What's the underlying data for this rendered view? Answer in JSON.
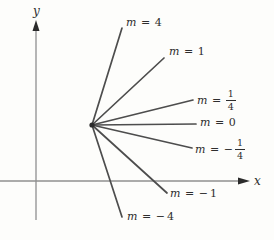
{
  "diagram": {
    "x_axis_label": "x",
    "y_axis_label": "y",
    "colors": {
      "background": "#fdfdfb",
      "axis": "#8f8f8f",
      "slope_line": "#4d4d4d",
      "arrowhead": "#2b2b2b",
      "text": "#2e2e2e"
    },
    "origin_point": {
      "x": 92,
      "y": 125
    },
    "axes": {
      "y_axis": {
        "x": 36,
        "top": 20,
        "bottom": 220,
        "label_x": 33,
        "label_y": 5
      },
      "x_axis": {
        "y": 181,
        "left": 0,
        "right": 250,
        "label_x": 254,
        "label_y": 175
      }
    },
    "lines": [
      {
        "id": "m-4",
        "slope": 4,
        "x2": 122,
        "y2": 28,
        "lx": 126,
        "ly": 17,
        "label": {
          "var": "m",
          "eq": "=",
          "sign": "",
          "whole": "4"
        }
      },
      {
        "id": "m-1",
        "slope": 1,
        "x2": 164,
        "y2": 58,
        "lx": 169,
        "ly": 46,
        "label": {
          "var": "m",
          "eq": "=",
          "sign": "",
          "whole": "1"
        }
      },
      {
        "id": "m-1-4",
        "slope": 0.25,
        "x2": 193,
        "y2": 100,
        "lx": 197,
        "ly": 90,
        "label": {
          "var": "m",
          "eq": "=",
          "sign": "",
          "num": "1",
          "den": "4"
        }
      },
      {
        "id": "m-0",
        "slope": 0,
        "x2": 196,
        "y2": 124,
        "lx": 200,
        "ly": 117,
        "label": {
          "var": "m",
          "eq": "=",
          "sign": "",
          "whole": "0"
        }
      },
      {
        "id": "m-neg-1-4",
        "slope": -0.25,
        "x2": 192,
        "y2": 148,
        "lx": 195,
        "ly": 139,
        "label": {
          "var": "m",
          "eq": "=",
          "sign": "−",
          "num": "1",
          "den": "4"
        }
      },
      {
        "id": "m-neg-1",
        "slope": -1,
        "x2": 167,
        "y2": 193,
        "lx": 170,
        "ly": 188,
        "label": {
          "var": "m",
          "eq": "=",
          "sign": "−",
          "whole": "1"
        }
      },
      {
        "id": "m-neg-4",
        "slope": -4,
        "x2": 122,
        "y2": 217,
        "lx": 127,
        "ly": 211,
        "label": {
          "var": "m",
          "eq": "=",
          "sign": "−",
          "whole": "4"
        }
      }
    ]
  }
}
